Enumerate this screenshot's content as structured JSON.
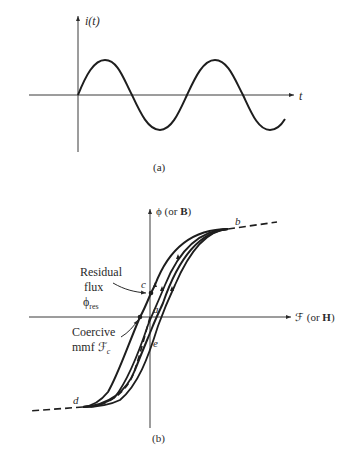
{
  "figure_a": {
    "y_axis_label": "i(t)",
    "x_axis_label": "t",
    "caption": "(a)",
    "curve": "sinusoid"
  },
  "figure_b": {
    "y_axis_label_symbol": "ϕ",
    "y_axis_label_rest": " (or ",
    "y_axis_label_bold": "B",
    "y_axis_label_close": ")",
    "x_axis_label_symbol": "ℱ",
    "x_axis_label_rest": " (or ",
    "x_axis_label_bold": "H",
    "x_axis_label_close": ")",
    "caption": "(b)",
    "points": {
      "a": "a",
      "b": "b",
      "c": "c",
      "d": "d",
      "e": "e"
    },
    "annotations": {
      "residual_line1": "Residual",
      "residual_line2": "flux",
      "residual_symbol": "ϕ",
      "residual_sub": "res",
      "coercive_line1": "Coercive",
      "coercive_line2": "mmf ",
      "coercive_symbol": "ℱ",
      "coercive_sub": "c"
    }
  },
  "colors": {
    "line": "#1e1e1e",
    "text": "#2a2a2a",
    "background": "#ffffff"
  }
}
